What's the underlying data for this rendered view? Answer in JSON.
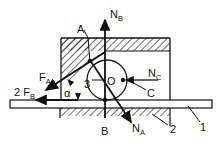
{
  "diagram": {
    "type": "free-body force diagram",
    "labels": {
      "NB": {
        "main": "N",
        "sub": "B"
      },
      "A": "A",
      "FA": {
        "main": "F",
        "sub": "A"
      },
      "two_FB": {
        "main": "2 F",
        "sub": "B"
      },
      "alpha": "α",
      "three": "3",
      "O": "O",
      "NC": {
        "main": "N",
        "sub": "C"
      },
      "C": "C",
      "B": "B",
      "NA": {
        "main": "N",
        "sub": "A"
      },
      "part2": "2",
      "part1": "1"
    },
    "colors": {
      "ink": "#111111",
      "background": "#ffffff"
    }
  }
}
